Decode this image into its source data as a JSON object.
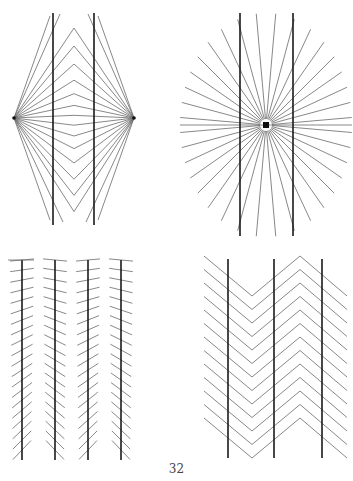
{
  "page": {
    "page_number": "32",
    "background": "#ffffff",
    "line_color": "#1a1a1a",
    "ray_color": "#6a6a6a"
  },
  "figures": [
    {
      "id": "top-left",
      "type": "Wundt-style illusion",
      "description": "Two parallel vertical lines crossed by rays from two focal points and nested chevrons",
      "focal_points": [
        [
          14,
          118
        ],
        [
          134,
          118
        ]
      ],
      "vertical_lines_x": [
        53,
        94
      ],
      "vertical_line_y": [
        13,
        225
      ],
      "chevron_center_x": 74
    },
    {
      "id": "top-right",
      "type": "Hering illusion",
      "description": "Two parallel vertical lines over rays radiating from a central point",
      "center": [
        266,
        125
      ],
      "vertical_lines_x": [
        240,
        293
      ],
      "vertical_line_y": [
        13,
        236
      ]
    },
    {
      "id": "bottom-left",
      "type": "Zöllner illusion",
      "description": "Four parallel vertical lines with alternating oblique hatch marks",
      "vertical_lines_x": [
        22,
        55,
        88,
        121
      ],
      "vertical_line_y": [
        260,
        460
      ]
    },
    {
      "id": "bottom-right",
      "type": "Zigzag-background illusion",
      "description": "Three parallel vertical lines over zigzag chevron pattern",
      "vertical_lines_x": [
        228,
        274,
        322
      ],
      "vertical_line_y": [
        259,
        458
      ]
    }
  ]
}
